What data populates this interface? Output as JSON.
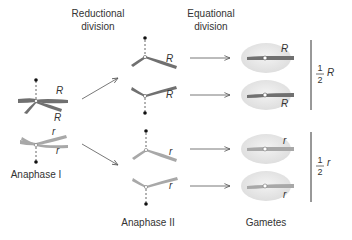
{
  "headings": {
    "reductional": [
      "Reductional",
      "division"
    ],
    "equational": [
      "Equational",
      "division"
    ]
  },
  "stage_labels": {
    "anaphase1": "Anaphase I",
    "anaphase2": "Anaphase II",
    "gametes": "Gametes"
  },
  "alleles": {
    "dominant": "R",
    "recessive": "r"
  },
  "fractions": {
    "top": {
      "num": "1",
      "den": "2",
      "allele": "R"
    },
    "bottom": {
      "num": "1",
      "den": "2",
      "allele": "r"
    }
  },
  "colors": {
    "dominant_chromosome": "#707070",
    "recessive_chromosome": "#a8a8a8",
    "cell": "#e6e6e6",
    "arrow": "#555555",
    "text": "#333333"
  }
}
